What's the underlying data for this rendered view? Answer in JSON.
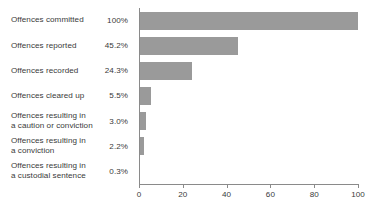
{
  "chart_data": {
    "type": "bar",
    "orientation": "horizontal",
    "title": "",
    "subtitle": "",
    "xlabel": "",
    "ylabel": "",
    "xlim": [
      0,
      100
    ],
    "xticks": [
      0,
      20,
      40,
      60,
      80,
      100
    ],
    "xtick_labels": [
      "0",
      "20",
      "40",
      "60",
      "80",
      "100"
    ],
    "grid": false,
    "legend": false,
    "bar_color": "#9a9a9a",
    "axis_color": "#8a8a8a",
    "text_color": "#3a3a3a",
    "categories": [
      "Offences committed",
      "Offences reported",
      "Offences recorded",
      "Offences cleared up",
      "Offences resulting in\na caution or conviction",
      "Offences resulting in\na conviction",
      "Offences resulting in\na custodial sentence"
    ],
    "values": [
      100,
      45.2,
      24.3,
      5.5,
      3.0,
      2.2,
      0.3
    ],
    "value_labels": [
      "100%",
      "45.2%",
      "24.3%",
      "5.5%",
      "3.0%",
      "2.2%",
      "0.3%"
    ]
  }
}
